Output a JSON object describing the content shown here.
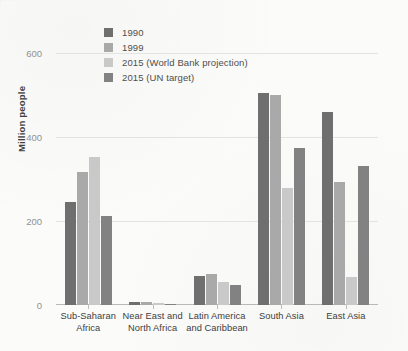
{
  "chart_data": {
    "type": "bar",
    "title": "",
    "xlabel": "",
    "ylabel": "Million people",
    "ylim": [
      0,
      600
    ],
    "yticks": [
      0,
      200,
      400,
      600
    ],
    "ytick_labels": [
      "0",
      "200",
      "400",
      "600"
    ],
    "grid": true,
    "legend_position": "top-left",
    "categories": [
      "Sub-Saharan Africa",
      "Near East and North Africa",
      "Latin America and Caribbean",
      "South Asia",
      "East Asia"
    ],
    "category_lines": [
      [
        "Sub-Saharan",
        "Africa"
      ],
      [
        "Near East and",
        "North Africa"
      ],
      [
        "Latin America",
        "and Caribbean"
      ],
      [
        "South Asia"
      ],
      [
        "East Asia"
      ]
    ],
    "series": [
      {
        "name": "1990",
        "color": "#6f6f6f",
        "values": [
          245,
          6,
          69,
          505,
          460
        ]
      },
      {
        "name": "1999",
        "color": "#a9a9a9",
        "values": [
          317,
          7,
          74,
          500,
          293
        ]
      },
      {
        "name": "2015 (World Bank projection)",
        "color": "#c9c9c9",
        "values": [
          352,
          5,
          55,
          279,
          67
        ]
      },
      {
        "name": "2015 (UN target)",
        "color": "#828282",
        "values": [
          212,
          3,
          48,
          374,
          331
        ]
      }
    ]
  }
}
